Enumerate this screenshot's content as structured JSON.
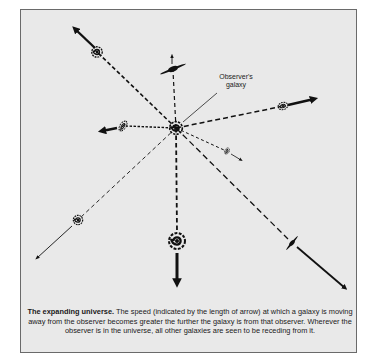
{
  "diagram": {
    "title": "The expanding universe.",
    "caption": "The speed (indicated by the length of arrow) at which a galaxy is moving away from the observer becomes greater the further the galaxy is from that observer. Wherever the observer is in the universe, all other galaxies are seen to be receding from it.",
    "labels": {
      "observer_line1": "Observer's",
      "observer_line2": "galaxy"
    },
    "center": {
      "x": 176,
      "y": 128
    },
    "galaxies": [
      {
        "id": "upper-left",
        "x": 97,
        "y": 52,
        "arrow_end": [
          72,
          26
        ],
        "weight": "heavy"
      },
      {
        "id": "top",
        "x": 173,
        "y": 69,
        "arrow_end": [
          172,
          53
        ],
        "weight": "light"
      },
      {
        "id": "right",
        "x": 283,
        "y": 106,
        "arrow_end": [
          320,
          98
        ],
        "weight": "heavy"
      },
      {
        "id": "left",
        "x": 123,
        "y": 126,
        "arrow_end": [
          98,
          131
        ],
        "weight": "heavy"
      },
      {
        "id": "right-small",
        "x": 227,
        "y": 151,
        "arrow_end": [
          244,
          161
        ],
        "weight": "light"
      },
      {
        "id": "lower-left",
        "x": 76,
        "y": 221,
        "arrow_end": [
          34,
          261
        ],
        "weight": "light"
      },
      {
        "id": "bottom",
        "x": 177,
        "y": 240,
        "arrow_end": [
          177,
          289
        ],
        "weight": "heavy"
      },
      {
        "id": "lower-right",
        "x": 292,
        "y": 243,
        "arrow_end": [
          349,
          292
        ],
        "weight": "medium"
      }
    ],
    "colors": {
      "background": "#e9e9e9",
      "ink": "#111111",
      "border": "#6a6a6a"
    }
  }
}
